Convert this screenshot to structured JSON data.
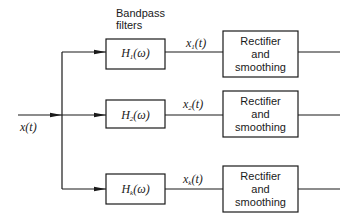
{
  "diagram": {
    "type": "block-diagram",
    "header_label": {
      "line1": "Bandpass",
      "line2": "filters"
    },
    "input": {
      "label_main": "x",
      "label_arg": "(t)"
    },
    "branches": [
      {
        "filter": {
          "main": "H",
          "sub": "1",
          "arg": "(ω)"
        },
        "signal": {
          "main": "x",
          "sub": "1",
          "arg": "(t)"
        },
        "block": {
          "line1": "Rectifier",
          "line2": "and",
          "line3": "smoothing"
        }
      },
      {
        "filter": {
          "main": "H",
          "sub": "2",
          "arg": "(ω)"
        },
        "signal": {
          "main": "x",
          "sub": "2",
          "arg": "(t)"
        },
        "block": {
          "line1": "Rectifier",
          "line2": "and",
          "line3": "smoothing"
        }
      },
      {
        "filter": {
          "main": "H",
          "sub": "k",
          "arg": "(ω)"
        },
        "signal": {
          "main": "x",
          "sub": "k",
          "arg": "(t)"
        },
        "block": {
          "line1": "Rectifier",
          "line2": "and",
          "line3": "smoothing"
        }
      }
    ],
    "colors": {
      "line": "#1a1a1a",
      "background": "#ffffff"
    }
  }
}
